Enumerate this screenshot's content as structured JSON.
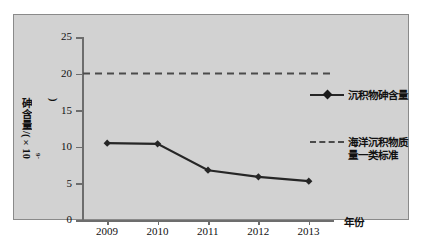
{
  "chart_data": {
    "type": "line",
    "title": "",
    "xlabel": "年份",
    "ylabel": "砷含量/(×10",
    "ylabel_exponent": "-6",
    "ylabel_suffix": ")",
    "categories": [
      "2009",
      "2010",
      "2011",
      "2012",
      "2013"
    ],
    "series": [
      {
        "name": "沉积物砷含量",
        "style": "solid-diamond",
        "values": [
          10.5,
          10.4,
          6.8,
          5.9,
          5.3
        ]
      },
      {
        "name": "海洋沉积物质量一类标准",
        "style": "dashed",
        "constant": 20,
        "values": [
          20,
          20,
          20,
          20,
          20
        ]
      }
    ],
    "ylim": [
      0,
      25
    ],
    "yticks": [
      0,
      5,
      10,
      15,
      20,
      25
    ],
    "ytick_labels": [
      "0",
      "5",
      "10",
      "15",
      "20",
      "25"
    ],
    "grid": false,
    "legend_position": "right",
    "colors": {
      "panel_background": "#d2d2d2",
      "figure_background": "#ffffff",
      "series_line": "#262626",
      "threshold_line": "#4b4b4b",
      "axis": "#6d6d6d",
      "text": "#111111"
    }
  },
  "legend": {
    "entries": [
      {
        "label": "沉积物砷含量"
      },
      {
        "label_line1": "海洋沉积物质",
        "label_line2": "量一类标准"
      }
    ]
  }
}
